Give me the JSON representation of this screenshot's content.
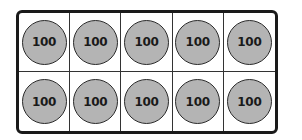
{
  "frame": {
    "rows": 2,
    "columns": 5,
    "disks": [
      {
        "label": "100"
      },
      {
        "label": "100"
      },
      {
        "label": "100"
      },
      {
        "label": "100"
      },
      {
        "label": "100"
      },
      {
        "label": "100"
      },
      {
        "label": "100"
      },
      {
        "label": "100"
      },
      {
        "label": "100"
      },
      {
        "label": "100"
      }
    ]
  },
  "colors": {
    "disk_fill": "#b4b4b4",
    "border": "#1a1a1a",
    "background": "#ffffff"
  }
}
